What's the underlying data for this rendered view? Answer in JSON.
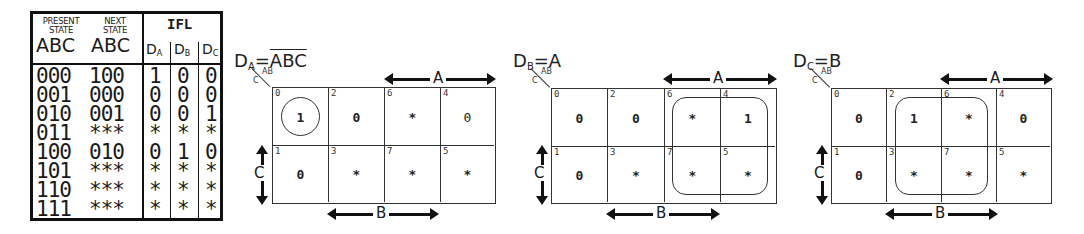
{
  "state_table": {
    "headers": {
      "present_small": [
        "PRESENT",
        "STATE"
      ],
      "present_vars": "ABC",
      "next_small": [
        "NEXT",
        "STATE"
      ],
      "next_vars": "ABC",
      "ifl": "IFL",
      "d_cols": [
        {
          "base": "D",
          "sub": "A"
        },
        {
          "base": "D",
          "sub": "B"
        },
        {
          "base": "D",
          "sub": "C"
        }
      ]
    },
    "rows": [
      {
        "present": "000",
        "next": "100",
        "da": "1",
        "db": "0",
        "dc": "0"
      },
      {
        "present": "001",
        "next": "000",
        "da": "0",
        "db": "0",
        "dc": "0"
      },
      {
        "present": "010",
        "next": "001",
        "da": "0",
        "db": "0",
        "dc": "1"
      },
      {
        "present": "011",
        "next": "***",
        "da": "*",
        "db": "*",
        "dc": "*"
      },
      {
        "present": "100",
        "next": "010",
        "da": "0",
        "db": "1",
        "dc": "0"
      },
      {
        "present": "101",
        "next": "***",
        "da": "*",
        "db": "*",
        "dc": "*"
      },
      {
        "present": "110",
        "next": "***",
        "da": "*",
        "db": "*",
        "dc": "*"
      },
      {
        "present": "111",
        "next": "***",
        "da": "*",
        "db": "*",
        "dc": "*"
      }
    ]
  },
  "kmaps": [
    {
      "name": "DA",
      "equation": {
        "lhs_base": "D",
        "lhs_sub": "A",
        "eq": "=",
        "rhs": [
          {
            "t": "A",
            "bar": true
          },
          {
            "t": "B",
            "bar": true
          },
          {
            "t": "C",
            "bar": true
          }
        ]
      },
      "corner_row_label": "AB",
      "corner_col_label": "C",
      "arrow_a": "A",
      "arrow_b": "B",
      "arrow_c": "C",
      "cells_top": [
        {
          "idx": "0",
          "val": "1"
        },
        {
          "idx": "2",
          "val": "0"
        },
        {
          "idx": "6",
          "val": "*"
        },
        {
          "idx": "4",
          "val": "0"
        }
      ],
      "cells_bottom": [
        {
          "idx": "1",
          "val": "0"
        },
        {
          "idx": "3",
          "val": "*"
        },
        {
          "idx": "7",
          "val": "*"
        },
        {
          "idx": "5",
          "val": "*"
        }
      ],
      "grouping": "circle on cell 0"
    },
    {
      "name": "DB",
      "equation": {
        "lhs_base": "D",
        "lhs_sub": "B",
        "eq": "=",
        "rhs": [
          {
            "t": "A",
            "bar": false
          }
        ]
      },
      "corner_row_label": "AB",
      "corner_col_label": "C",
      "arrow_a": "A",
      "arrow_b": "B",
      "arrow_c": "C",
      "cells_top": [
        {
          "idx": "0",
          "val": "0"
        },
        {
          "idx": "2",
          "val": "0"
        },
        {
          "idx": "6",
          "val": "*"
        },
        {
          "idx": "4",
          "val": "1"
        }
      ],
      "cells_bottom": [
        {
          "idx": "1",
          "val": "0"
        },
        {
          "idx": "3",
          "val": "*"
        },
        {
          "idx": "7",
          "val": "*"
        },
        {
          "idx": "5",
          "val": "*"
        }
      ],
      "grouping": "loop over cells 6,4,7,5"
    },
    {
      "name": "DC",
      "equation": {
        "lhs_base": "D",
        "lhs_sub": "C",
        "eq": "=",
        "rhs": [
          {
            "t": "B",
            "bar": false
          }
        ]
      },
      "corner_row_label": "AB",
      "corner_col_label": "C",
      "arrow_a": "A",
      "arrow_b": "B",
      "arrow_c": "C",
      "cells_top": [
        {
          "idx": "0",
          "val": "0"
        },
        {
          "idx": "2",
          "val": "1"
        },
        {
          "idx": "6",
          "val": "*"
        },
        {
          "idx": "4",
          "val": "0"
        }
      ],
      "cells_bottom": [
        {
          "idx": "1",
          "val": "0"
        },
        {
          "idx": "3",
          "val": "*"
        },
        {
          "idx": "7",
          "val": "*"
        },
        {
          "idx": "5",
          "val": "*"
        }
      ],
      "grouping": "loop over cells 2,6,3,7"
    }
  ]
}
